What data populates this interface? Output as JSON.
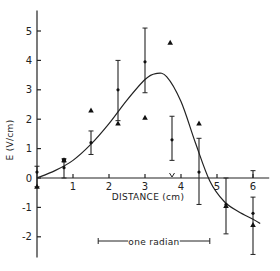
{
  "chart_data": {
    "type": "scatter",
    "title": "",
    "xlabel": "DISTANCE (cm)",
    "ylabel": "E (V/cm)",
    "xlim": [
      0,
      6.4
    ],
    "ylim": [
      -2.7,
      5.7
    ],
    "x_ticks": [
      1,
      2,
      3,
      4,
      5,
      6
    ],
    "y_ticks": [
      -2,
      -1,
      0,
      1,
      2,
      3,
      4,
      5
    ],
    "grid": false,
    "legend": null,
    "annotations": [
      {
        "text": "one radian",
        "type": "scale-bar",
        "x_start": 1.7,
        "x_end": 4.8,
        "y": -2.1
      },
      {
        "text": "v",
        "type": "marker",
        "x": 3.75,
        "y": 0
      }
    ],
    "series": [
      {
        "name": "measured (dots with error bars)",
        "marker": "dot",
        "points": [
          {
            "x": 0.0,
            "y": 0.2,
            "err_low": -0.3,
            "err_high": 0.4
          },
          {
            "x": 0.75,
            "y": 0.35,
            "err_low": 0.0,
            "err_high": 0.65
          },
          {
            "x": 1.5,
            "y": 1.2,
            "err_low": 0.8,
            "err_high": 1.6
          },
          {
            "x": 2.25,
            "y": 3.0,
            "err_low": 1.95,
            "err_high": 4.0
          },
          {
            "x": 3.0,
            "y": 3.95,
            "err_low": 2.9,
            "err_high": 5.1
          },
          {
            "x": 3.75,
            "y": 1.3,
            "err_low": 0.6,
            "err_high": 2.1
          },
          {
            "x": 4.5,
            "y": 0.2,
            "err_low": -0.9,
            "err_high": 1.35
          },
          {
            "x": 5.25,
            "y": -0.9,
            "err_low": -1.9,
            "err_high": 0.0
          },
          {
            "x": 6.0,
            "y": -1.2,
            "err_low": -2.6,
            "err_high": -0.65
          }
        ]
      },
      {
        "name": "triangles",
        "marker": "triangle",
        "points": [
          {
            "x": 0.0,
            "y": -0.3
          },
          {
            "x": 0.75,
            "y": 0.6
          },
          {
            "x": 1.5,
            "y": 2.3
          },
          {
            "x": 2.25,
            "y": 1.85
          },
          {
            "x": 3.0,
            "y": 2.05
          },
          {
            "x": 3.7,
            "y": 4.6
          },
          {
            "x": 4.5,
            "y": 1.85
          },
          {
            "x": 5.25,
            "y": -0.95
          },
          {
            "x": 6.0,
            "y": -1.6
          }
        ]
      },
      {
        "name": "fitted curve",
        "marker": "line",
        "points": [
          {
            "x": 0.0,
            "y": 0.0
          },
          {
            "x": 0.5,
            "y": 0.25
          },
          {
            "x": 1.0,
            "y": 0.6
          },
          {
            "x": 1.5,
            "y": 1.15
          },
          {
            "x": 2.0,
            "y": 1.85
          },
          {
            "x": 2.5,
            "y": 2.65
          },
          {
            "x": 3.0,
            "y": 3.35
          },
          {
            "x": 3.3,
            "y": 3.55
          },
          {
            "x": 3.6,
            "y": 3.45
          },
          {
            "x": 4.0,
            "y": 2.6
          },
          {
            "x": 4.4,
            "y": 1.2
          },
          {
            "x": 4.8,
            "y": -0.1
          },
          {
            "x": 5.2,
            "y": -0.8
          },
          {
            "x": 5.6,
            "y": -1.15
          },
          {
            "x": 6.0,
            "y": -1.4
          },
          {
            "x": 6.2,
            "y": -1.55
          }
        ]
      }
    ]
  },
  "labels": {
    "xlabel": "DISTANCE (cm)",
    "ylabel": "E (V/cm)",
    "scale_bar": "one radian"
  }
}
